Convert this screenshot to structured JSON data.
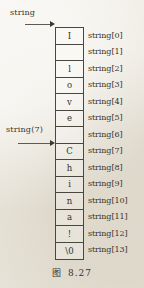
{
  "figure": {
    "caption_label": "图",
    "caption_number": "8.27"
  },
  "pointers": [
    {
      "name": "string-pointer",
      "label": "string",
      "target_index": 0
    },
    {
      "name": "string7-pointer",
      "label": "string(7)",
      "target_index": 7
    }
  ],
  "array": {
    "name": "string",
    "length": 14,
    "cells": [
      {
        "index": 0,
        "char": "I",
        "label": "string[0]"
      },
      {
        "index": 1,
        "char": " ",
        "label": "string[1]"
      },
      {
        "index": 2,
        "char": "l",
        "label": "string[2]"
      },
      {
        "index": 3,
        "char": "o",
        "label": "string[3]"
      },
      {
        "index": 4,
        "char": "v",
        "label": "string[4]"
      },
      {
        "index": 5,
        "char": "e",
        "label": "string[5]"
      },
      {
        "index": 6,
        "char": " ",
        "label": "string[6]"
      },
      {
        "index": 7,
        "char": "C",
        "label": "string[7]"
      },
      {
        "index": 8,
        "char": "h",
        "label": "string[8]"
      },
      {
        "index": 9,
        "char": "i",
        "label": "string[9]"
      },
      {
        "index": 10,
        "char": "n",
        "label": "string[10]"
      },
      {
        "index": 11,
        "char": "a",
        "label": "string[11]"
      },
      {
        "index": 12,
        "char": "!",
        "label": "string[12]"
      },
      {
        "index": 13,
        "char": "\\0",
        "label": "string[13]"
      }
    ]
  },
  "colors": {
    "paper": "#efece4",
    "ink": "#35322c",
    "rule": "#4a473f"
  }
}
